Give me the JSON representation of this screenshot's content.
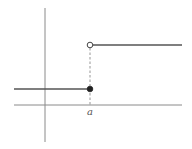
{
  "diagram": {
    "type": "step-function-jump-discontinuity",
    "colors": {
      "background": "#ffffff",
      "axis": "#8a8a8a",
      "line": "#555555",
      "dot_fill": "#222222",
      "open_dot_fill": "#ffffff"
    },
    "axes": {
      "x_axis": {
        "x1": 14,
        "x2": 182,
        "y": 105
      },
      "y_axis": {
        "x": 45,
        "y1": 8,
        "y2": 142
      }
    },
    "segments": [
      {
        "name": "lower-step",
        "x1": 14,
        "x2": 90,
        "y": 89,
        "right_endpoint": "closed"
      },
      {
        "name": "upper-step",
        "x1": 90,
        "x2": 182,
        "y": 45,
        "left_endpoint": "open"
      }
    ],
    "points": {
      "closed": {
        "cx": 90,
        "cy": 89,
        "r": 2.8
      },
      "open": {
        "cx": 90,
        "cy": 45,
        "r": 2.8
      }
    },
    "guide_line": {
      "x": 90,
      "y1": 45,
      "y2": 105,
      "style": "dashed"
    },
    "labels": {
      "x_tick": "a"
    }
  }
}
